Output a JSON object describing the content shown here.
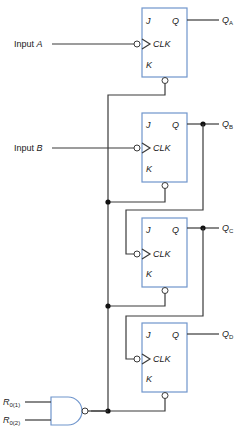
{
  "diagram": {
    "type": "ripple counter circuit (4 JK flip-flops with NAND reset)",
    "inputs": {
      "input_a": {
        "prefix": "Input ",
        "var": "A"
      },
      "input_b": {
        "prefix": "Input ",
        "var": "B"
      },
      "reset_1": {
        "var": "R",
        "sub": "0(1)"
      },
      "reset_2": {
        "var": "R",
        "sub": "0(2)"
      }
    },
    "flip_flops": [
      {
        "id": "ff-a",
        "j": "J",
        "q": "Q",
        "clk": "CLK",
        "k": "K",
        "output": "Q",
        "output_sub": "A"
      },
      {
        "id": "ff-b",
        "j": "J",
        "q": "Q",
        "clk": "CLK",
        "k": "K",
        "output": "Q",
        "output_sub": "B"
      },
      {
        "id": "ff-c",
        "j": "J",
        "q": "Q",
        "clk": "CLK",
        "k": "K",
        "output": "Q",
        "output_sub": "C"
      },
      {
        "id": "ff-d",
        "j": "J",
        "q": "Q",
        "clk": "CLK",
        "k": "K",
        "output": "Q",
        "output_sub": "D"
      }
    ],
    "colors": {
      "box_border": "#6f95cc",
      "wire": "#3a3a3a"
    }
  }
}
